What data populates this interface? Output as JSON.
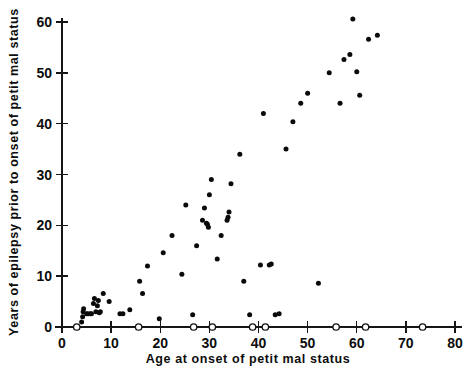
{
  "chart_data": {
    "type": "scatter",
    "title": "",
    "xlabel": "Age at onset of petit mal status",
    "ylabel": "Years of epilepsy prior to onset of petit mal status",
    "xlim": [
      0,
      80
    ],
    "ylim": [
      0,
      62
    ],
    "xticks": [
      0,
      10,
      20,
      30,
      40,
      50,
      60,
      70,
      80
    ],
    "yticks": [
      0,
      10,
      20,
      30,
      40,
      50,
      60
    ],
    "xtick_labels": [
      "0",
      "10",
      "20",
      "30",
      "40",
      "50",
      "60",
      "70",
      "80"
    ],
    "ytick_labels": [
      "0",
      "10",
      "20",
      "30",
      "40",
      "50",
      "60"
    ],
    "grid": false,
    "legend": "none",
    "series": [
      {
        "name": "observed",
        "marker": "filled-circle",
        "color": "#0a0a0a",
        "points": [
          [
            4.0,
            1.0
          ],
          [
            4.2,
            2.0
          ],
          [
            4.3,
            3.0
          ],
          [
            4.4,
            3.6
          ],
          [
            5.0,
            2.6
          ],
          [
            5.3,
            2.6
          ],
          [
            5.8,
            2.6
          ],
          [
            6.0,
            2.6
          ],
          [
            6.4,
            4.6
          ],
          [
            6.6,
            5.6
          ],
          [
            6.9,
            3.0
          ],
          [
            7.2,
            4.2
          ],
          [
            7.4,
            5.2
          ],
          [
            7.6,
            2.8
          ],
          [
            7.8,
            3.0
          ],
          [
            8.4,
            6.6
          ],
          [
            9.6,
            5.0
          ],
          [
            11.8,
            2.6
          ],
          [
            12.4,
            2.6
          ],
          [
            13.8,
            3.4
          ],
          [
            15.8,
            9.0
          ],
          [
            16.4,
            6.6
          ],
          [
            17.4,
            12.0
          ],
          [
            19.8,
            1.6
          ],
          [
            20.6,
            14.6
          ],
          [
            22.4,
            18.0
          ],
          [
            24.4,
            10.4
          ],
          [
            25.2,
            24.0
          ],
          [
            26.6,
            2.4
          ],
          [
            27.4,
            16.0
          ],
          [
            28.6,
            21.0
          ],
          [
            29.0,
            23.4
          ],
          [
            29.4,
            20.4
          ],
          [
            29.6,
            20.2
          ],
          [
            29.8,
            19.6
          ],
          [
            30.0,
            26.0
          ],
          [
            30.4,
            29.0
          ],
          [
            31.6,
            13.4
          ],
          [
            32.4,
            18.0
          ],
          [
            33.6,
            21.0
          ],
          [
            33.8,
            21.6
          ],
          [
            34.0,
            22.6
          ],
          [
            34.4,
            28.2
          ],
          [
            36.2,
            34.0
          ],
          [
            37.0,
            9.0
          ],
          [
            38.2,
            2.4
          ],
          [
            40.4,
            12.2
          ],
          [
            41.0,
            42.0
          ],
          [
            42.2,
            12.2
          ],
          [
            42.6,
            12.4
          ],
          [
            43.4,
            2.4
          ],
          [
            44.2,
            2.6
          ],
          [
            45.6,
            35.0
          ],
          [
            47.0,
            40.4
          ],
          [
            48.6,
            44.0
          ],
          [
            50.0,
            46.0
          ],
          [
            52.2,
            8.6
          ],
          [
            54.4,
            50.0
          ],
          [
            56.6,
            44.0
          ],
          [
            57.4,
            52.6
          ],
          [
            58.6,
            53.6
          ],
          [
            59.2,
            60.6
          ],
          [
            60.0,
            50.2
          ],
          [
            60.6,
            45.6
          ],
          [
            62.4,
            56.6
          ],
          [
            64.2,
            57.4
          ]
        ]
      },
      {
        "name": "censored",
        "marker": "open-circle",
        "color": "#111111",
        "points": [
          [
            3.0,
            0
          ],
          [
            15.6,
            0
          ],
          [
            26.8,
            0
          ],
          [
            30.6,
            0
          ],
          [
            38.8,
            0
          ],
          [
            41.4,
            0
          ],
          [
            55.8,
            0
          ],
          [
            61.8,
            0
          ],
          [
            73.4,
            0
          ]
        ]
      }
    ]
  },
  "figure": {
    "background": "#ffffff",
    "axis_color": "#161616"
  }
}
